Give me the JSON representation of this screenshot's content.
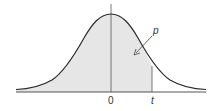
{
  "diagram": {
    "labels": {
      "origin": "0",
      "t": "t",
      "p": "p"
    },
    "colors": {
      "curve": "#2b2b2b",
      "fill": "#e6e6e6",
      "axis": "#555555"
    }
  }
}
